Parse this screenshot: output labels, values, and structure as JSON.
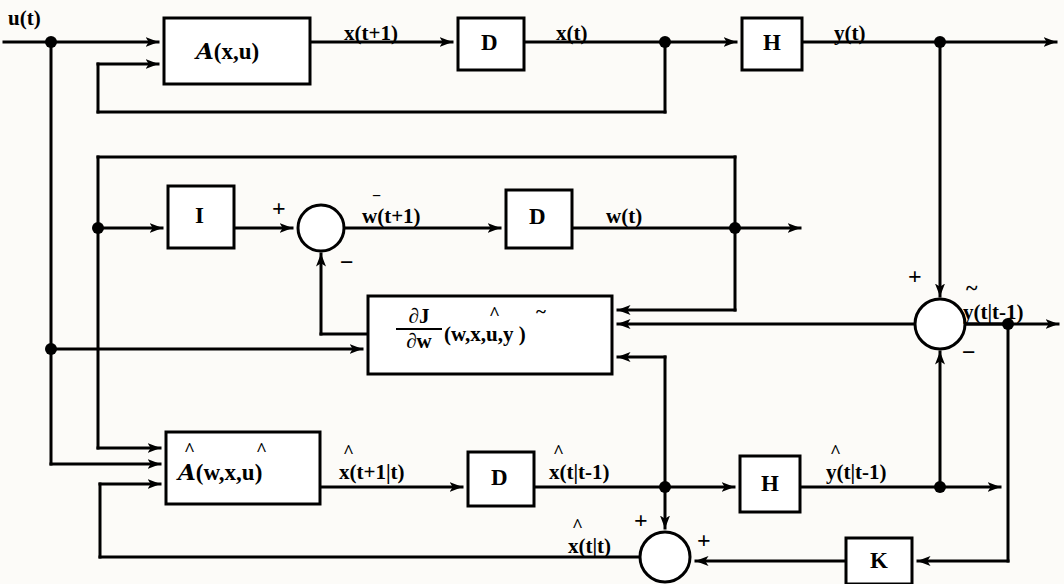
{
  "diagram": {
    "stroke_color": "#000000",
    "background_color": "#fcfbf8"
  },
  "blocks": [
    {
      "id": "A_xu",
      "label": "(x,u)",
      "prefix": "A",
      "x": 164,
      "y": 18,
      "w": 146,
      "h": 66
    },
    {
      "id": "D_top",
      "label": "D",
      "x": 458,
      "y": 18,
      "w": 66,
      "h": 52
    },
    {
      "id": "H_top",
      "label": "H",
      "x": 742,
      "y": 18,
      "w": 60,
      "h": 52
    },
    {
      "id": "I_block",
      "label": "I",
      "x": 168,
      "y": 186,
      "w": 66,
      "h": 62
    },
    {
      "id": "D_mid",
      "label": "D",
      "x": 506,
      "y": 190,
      "w": 66,
      "h": 58
    },
    {
      "id": "grad",
      "label": "(w,x,u,y )",
      "x": 368,
      "y": 296,
      "w": 244,
      "h": 78
    },
    {
      "id": "A_hat",
      "label": "(w,x,u)",
      "x": 166,
      "y": 432,
      "w": 154,
      "h": 72
    },
    {
      "id": "D_bot",
      "label": "D",
      "x": 468,
      "y": 452,
      "w": 66,
      "h": 54
    },
    {
      "id": "H_bot",
      "label": "H",
      "x": 740,
      "y": 456,
      "w": 60,
      "h": 56
    },
    {
      "id": "K_block",
      "label": "K",
      "x": 846,
      "y": 538,
      "w": 66,
      "h": 46
    }
  ],
  "signals": {
    "u_t": "u(t)",
    "x_tp1": "x(t+1)",
    "x_t": "x(t)",
    "y_t": "y(t)",
    "w_tp1": "w(t+1)",
    "w_t": "w(t)",
    "xhat_tp1t": "x(t+1|t)",
    "xhat_ttm1": "x(t|t-1)",
    "xhat_tt": "x(t|t)",
    "yhat_ttm1": "y(t|t-1)",
    "ytilde_ttm1": "y(t|t-1)"
  },
  "block_text": {
    "A_script": "A",
    "A_hat_script": "A",
    "I": "I",
    "D": "D",
    "H": "H",
    "K": "K",
    "grad_num": "∂J",
    "grad_den": "∂w",
    "grad_args": "(w,x,u,y )"
  },
  "accents": {
    "hat": "^",
    "tilde": "~"
  },
  "signs": {
    "plus": "+",
    "minus": "−"
  },
  "junction_nodes": [
    {
      "name": "u-tap",
      "x": 51,
      "y": 42
    },
    {
      "name": "w-feedback-tap",
      "x": 98,
      "y": 228
    },
    {
      "name": "u-lower-tap",
      "x": 51,
      "y": 349
    },
    {
      "name": "x-state-tap",
      "x": 665,
      "y": 42
    },
    {
      "name": "y-output-tap",
      "x": 940,
      "y": 42
    },
    {
      "name": "w-output-tap",
      "x": 735,
      "y": 228
    },
    {
      "name": "ytilde-tap",
      "x": 1008,
      "y": 324
    },
    {
      "name": "xhat-tap",
      "x": 665,
      "y": 487
    },
    {
      "name": "yhat-tap",
      "x": 940,
      "y": 487
    }
  ],
  "summing_circles": [
    {
      "name": "w-update-sum",
      "cx": 321,
      "cy": 228,
      "r": 23,
      "inputs": [
        "+ left",
        "− bottom"
      ]
    },
    {
      "name": "innovation-sum",
      "cx": 940,
      "cy": 324,
      "r": 25,
      "inputs": [
        "+ top",
        "− bottom"
      ]
    },
    {
      "name": "state-correction-sum",
      "cx": 665,
      "cy": 557,
      "r": 25,
      "inputs": [
        "+ top",
        "+ right"
      ]
    }
  ]
}
